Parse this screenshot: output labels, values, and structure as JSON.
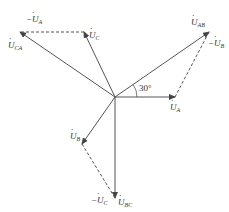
{
  "diagram": {
    "type": "phasor-diagram",
    "origin": {
      "x": 115,
      "y": 97
    },
    "colors": {
      "solid": "#555555",
      "dashed": "#555555",
      "text": "#333333"
    },
    "phasors": [
      {
        "id": "UA",
        "label": "U",
        "sub": "A",
        "prefix": "",
        "end": {
          "x": 175,
          "y": 97
        }
      },
      {
        "id": "UAB",
        "label": "U",
        "sub": "AB",
        "prefix": "",
        "end": {
          "x": 209,
          "y": 32
        }
      },
      {
        "id": "UC",
        "label": "U",
        "sub": "C",
        "prefix": "",
        "end": {
          "x": 84,
          "y": 32
        }
      },
      {
        "id": "UCA",
        "label": "U",
        "sub": "CA",
        "prefix": "",
        "end": {
          "x": 20,
          "y": 32
        }
      },
      {
        "id": "UB",
        "label": "U",
        "sub": "B",
        "prefix": "",
        "end": {
          "x": 82,
          "y": 144
        }
      },
      {
        "id": "UBC",
        "label": "U",
        "sub": "BC",
        "prefix": "",
        "end": {
          "x": 115,
          "y": 198
        }
      }
    ],
    "dashed_phasors": [
      {
        "id": "negUB",
        "label": "U",
        "sub": "B",
        "prefix": "−",
        "start": {
          "x": 175,
          "y": 97
        },
        "end": {
          "x": 209,
          "y": 32
        }
      },
      {
        "id": "negUA",
        "label": "U",
        "sub": "A",
        "prefix": "−",
        "start": {
          "x": 84,
          "y": 32
        },
        "end": {
          "x": 20,
          "y": 32
        }
      },
      {
        "id": "negUC",
        "label": "U",
        "sub": "C",
        "prefix": "−",
        "start": {
          "x": 82,
          "y": 144
        },
        "end": {
          "x": 115,
          "y": 198
        }
      }
    ],
    "angle": {
      "text": "30°",
      "between": [
        "UA",
        "UAB"
      ]
    }
  }
}
